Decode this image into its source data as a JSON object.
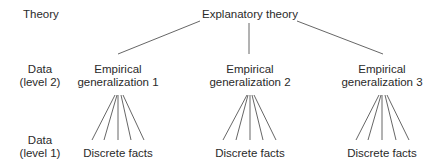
{
  "row_labels": {
    "theory": "Theory",
    "level2": [
      "Data",
      "(level 2)"
    ],
    "level1": [
      "Data",
      "(level 1)"
    ]
  },
  "root": {
    "label": "Explanatory theory"
  },
  "generalizations": [
    {
      "line1": "Empirical",
      "line2": "generalization 1",
      "facts": "Discrete facts"
    },
    {
      "line1": "Empirical",
      "line2": "generalization 2",
      "facts": "Discrete facts"
    },
    {
      "line1": "Empirical",
      "line2": "generalization 3",
      "facts": "Discrete facts"
    }
  ],
  "colors": {
    "line": "#555555",
    "text": "#2a2a2a"
  }
}
